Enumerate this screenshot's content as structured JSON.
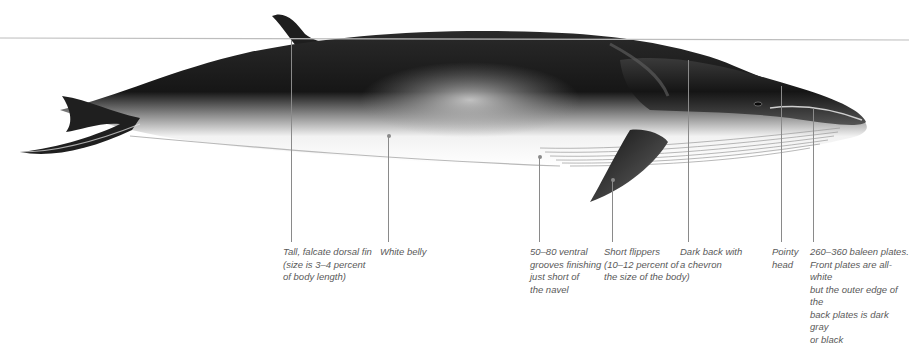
{
  "header": {
    "clipped_text": "· · · · ·  · · · · · · ·"
  },
  "illustration": {
    "subject": "whale-side-view",
    "colors": {
      "dark_back": "#1a1a1a",
      "mid_gray": "#6e6e6e",
      "belly": "#ffffff",
      "horizon_line": "#bdbdbd",
      "leader_line": "#8a8a8a",
      "caption_text": "#5a5a5a"
    }
  },
  "annotations": [
    {
      "id": "dorsal-fin",
      "x": 291,
      "y_top": 40,
      "text": "Tall, falcate dorsal fin\n(size is 3–4 percent\nof body length)"
    },
    {
      "id": "white-belly",
      "x": 388,
      "y_top": 136,
      "text": "White belly"
    },
    {
      "id": "ventral-grooves",
      "x": 539,
      "y_top": 157,
      "text": "50–80 ventral\ngrooves finishing\njust short of\nthe navel"
    },
    {
      "id": "short-flippers",
      "x": 612,
      "y_top": 180,
      "text": "Short flippers\n(10–12 percent of\nthe size of the body)"
    },
    {
      "id": "dark-back",
      "x": 688,
      "y_top": 60,
      "text": "Dark back with\na chevron"
    },
    {
      "id": "pointy-head",
      "x": 781,
      "y_top": 86,
      "text": "Pointy\nhead"
    },
    {
      "id": "baleen-plates",
      "x": 813,
      "y_top": 108,
      "text": "260–360 baleen plates.\nFront plates are all-white\nbut the outer edge of the\nback plates is dark gray\nor black"
    }
  ]
}
